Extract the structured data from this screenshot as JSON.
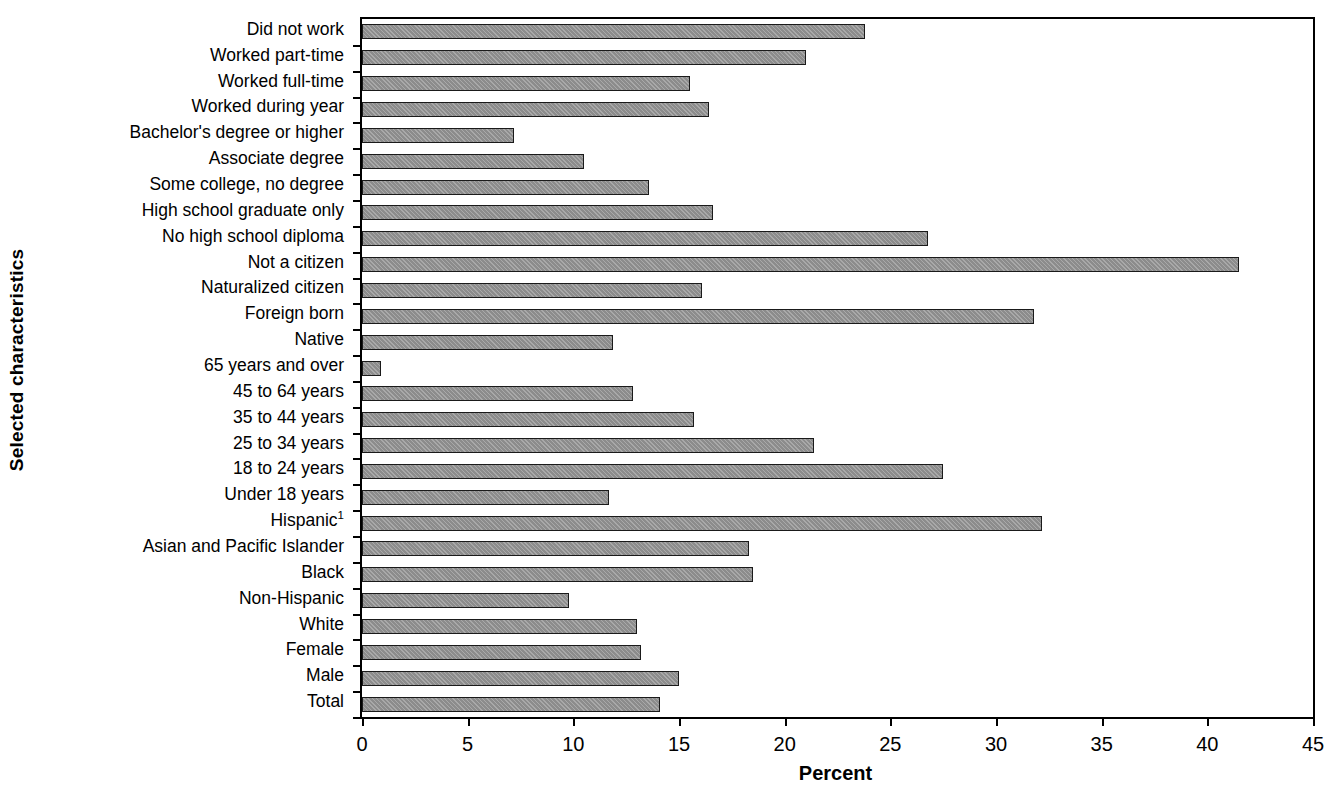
{
  "chart_data": {
    "type": "bar",
    "orientation": "horizontal",
    "title": "",
    "xlabel": "Percent",
    "ylabel": "Selected characteristics",
    "xlim": [
      0,
      45
    ],
    "xticks": [
      "0",
      "5",
      "10",
      "15",
      "20",
      "25",
      "30",
      "35",
      "40",
      "45"
    ],
    "grid": false,
    "legend": null,
    "bar_color": "#8c8c8c",
    "bar_edge_color": "#1a1a1a",
    "footnote_marker": "1",
    "categories": [
      "Did not work",
      "Worked part-time",
      "Worked full-time",
      "Worked during year",
      "Bachelor's degree or higher",
      "Associate degree",
      "Some college, no degree",
      "High school graduate only",
      "No high school diploma",
      "Not a citizen",
      "Naturalized citizen",
      "Foreign born",
      "Native",
      "65 years and over",
      "45 to 64 years",
      "35 to 44 years",
      "25 to 34 years",
      "18 to 24 years",
      "Under 18 years",
      "Hispanic",
      "Asian and Pacific Islander",
      "Black",
      "Non-Hispanic",
      "White",
      "Female",
      "Male",
      "Total"
    ],
    "category_superscripts": {
      "Hispanic": "1"
    },
    "values": [
      23.8,
      21.0,
      15.5,
      16.4,
      7.2,
      10.5,
      13.6,
      16.6,
      26.8,
      41.5,
      16.1,
      31.8,
      11.9,
      0.9,
      12.8,
      15.7,
      21.4,
      27.5,
      11.7,
      32.2,
      18.3,
      18.5,
      9.8,
      13.0,
      13.2,
      15.0,
      14.1
    ]
  }
}
